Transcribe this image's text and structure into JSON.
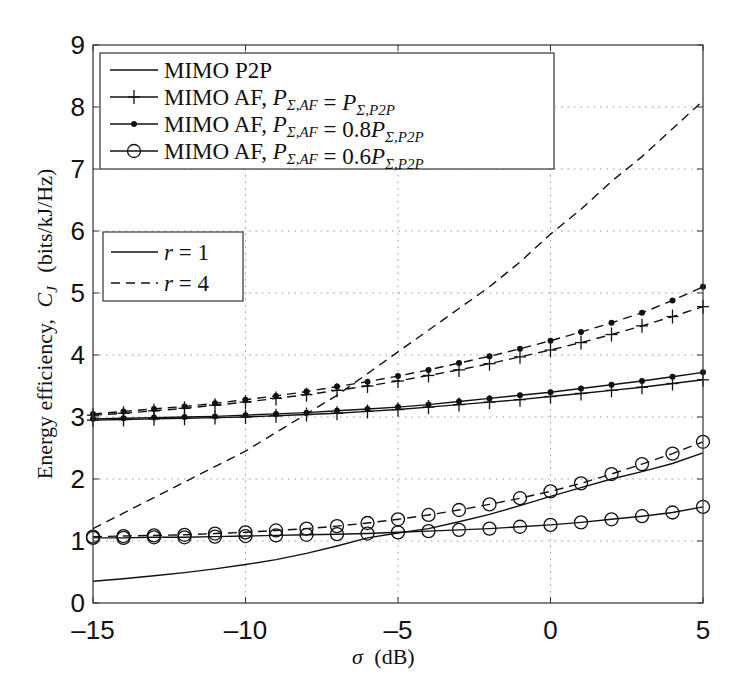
{
  "chart_data": {
    "type": "line",
    "title": "",
    "xlabel": "σ (dB)",
    "ylabel": "Energy efficiency, C_J (bits/kJ/Hz)",
    "xlim": [
      -15,
      5
    ],
    "ylim": [
      0,
      9
    ],
    "xticks": [
      -15,
      -10,
      -5,
      0,
      5
    ],
    "yticks": [
      0,
      1,
      2,
      3,
      4,
      5,
      6,
      7,
      8,
      9
    ],
    "grid": true,
    "x": [
      -15,
      -14,
      -13,
      -12,
      -11,
      -10,
      -9,
      -8,
      -7,
      -6,
      -5,
      -4,
      -3,
      -2,
      -1,
      0,
      1,
      2,
      3,
      4,
      5
    ],
    "legend_scheme": {
      "position": "upper left",
      "entries": [
        {
          "label": "MIMO P2P",
          "marker": "none"
        },
        {
          "label": "MIMO AF, P_{Σ,AF} = P_{Σ,P2P}",
          "marker": "plus"
        },
        {
          "label": "MIMO AF, P_{Σ,AF} = 0.8P_{Σ,P2P}",
          "marker": "dot"
        },
        {
          "label": "MIMO AF, P_{Σ,AF} = 0.6P_{Σ,P2P}",
          "marker": "circle"
        }
      ]
    },
    "legend_r": {
      "position": "middle left",
      "entries": [
        {
          "label": "r = 1",
          "dash": "solid"
        },
        {
          "label": "r = 4",
          "dash": "dashed"
        }
      ]
    },
    "series": [
      {
        "name": "MIMO P2P, r = 1",
        "marker": "none",
        "dash": "solid",
        "values": [
          0.35,
          0.39,
          0.44,
          0.49,
          0.55,
          0.62,
          0.7,
          0.8,
          0.92,
          1.05,
          1.13,
          1.2,
          1.31,
          1.43,
          1.57,
          1.72,
          1.86,
          2.0,
          2.12,
          2.25,
          2.42
        ]
      },
      {
        "name": "MIMO P2P, r = 4",
        "marker": "none",
        "dash": "dashed",
        "values": [
          1.2,
          1.45,
          1.7,
          1.95,
          2.2,
          2.45,
          2.75,
          3.05,
          3.35,
          3.7,
          4.05,
          4.4,
          4.75,
          5.1,
          5.5,
          5.95,
          6.35,
          6.8,
          7.2,
          7.65,
          8.1
        ]
      },
      {
        "name": "MIMO AF, P_AF = P_P2P, r = 1",
        "marker": "plus",
        "dash": "solid",
        "values": [
          2.95,
          2.96,
          2.97,
          2.98,
          2.99,
          3.0,
          3.02,
          3.04,
          3.06,
          3.09,
          3.12,
          3.16,
          3.2,
          3.24,
          3.28,
          3.33,
          3.38,
          3.43,
          3.48,
          3.54,
          3.6
        ]
      },
      {
        "name": "MIMO AF, P_AF = 0.8 P_P2P, r = 1",
        "marker": "dot",
        "dash": "solid",
        "values": [
          2.97,
          2.98,
          2.99,
          3.0,
          3.01,
          3.03,
          3.05,
          3.07,
          3.1,
          3.13,
          3.16,
          3.2,
          3.25,
          3.3,
          3.35,
          3.4,
          3.46,
          3.52,
          3.58,
          3.65,
          3.72
        ]
      },
      {
        "name": "MIMO AF, P_AF = P_P2P, r = 4",
        "marker": "plus",
        "dash": "dashed",
        "values": [
          3.03,
          3.06,
          3.1,
          3.14,
          3.19,
          3.24,
          3.3,
          3.36,
          3.43,
          3.5,
          3.58,
          3.67,
          3.76,
          3.86,
          3.97,
          4.08,
          4.2,
          4.33,
          4.47,
          4.62,
          4.78
        ]
      },
      {
        "name": "MIMO AF, P_AF = 0.8 P_P2P, r = 4",
        "marker": "dot",
        "dash": "dashed",
        "values": [
          3.05,
          3.09,
          3.13,
          3.17,
          3.22,
          3.28,
          3.34,
          3.41,
          3.49,
          3.57,
          3.66,
          3.76,
          3.87,
          3.98,
          4.1,
          4.23,
          4.37,
          4.52,
          4.68,
          4.88,
          5.1
        ]
      },
      {
        "name": "MIMO AF, P_AF = 0.6 P_P2P, r = 1",
        "marker": "circle",
        "dash": "solid",
        "values": [
          1.05,
          1.05,
          1.06,
          1.06,
          1.07,
          1.08,
          1.09,
          1.1,
          1.11,
          1.12,
          1.14,
          1.16,
          1.18,
          1.2,
          1.23,
          1.26,
          1.3,
          1.35,
          1.4,
          1.46,
          1.55
        ]
      },
      {
        "name": "MIMO AF, P_AF = 0.6 P_P2P, r = 4",
        "marker": "circle",
        "dash": "dashed",
        "values": [
          1.07,
          1.08,
          1.09,
          1.1,
          1.12,
          1.14,
          1.17,
          1.2,
          1.24,
          1.29,
          1.35,
          1.42,
          1.5,
          1.59,
          1.69,
          1.8,
          1.93,
          2.08,
          2.24,
          2.41,
          2.6
        ]
      }
    ]
  },
  "labels": {
    "xlabel_sigma": "σ",
    "xlabel_unit": "(dB)",
    "ylabel_text": "Energy efficiency,",
    "ylabel_var": "C",
    "ylabel_sub": "J",
    "ylabel_unit": "(bits/kJ/Hz)"
  }
}
